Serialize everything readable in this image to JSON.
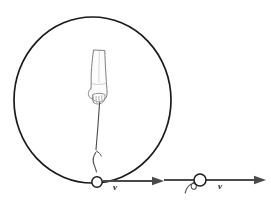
{
  "figure": {
    "background_color": "#ffffff",
    "width": 271,
    "height": 203,
    "stroke_color": "#1a1a1a",
    "arrow_color": "#3a3a3a",
    "hand_fill": "#fbfbfb",
    "hand_outline": "#6a6a6a"
  },
  "circle_path": {
    "name": "circular-path",
    "center_x": 92.5,
    "center_y": 100,
    "radius_x": 78.5,
    "radius_y": 83,
    "stroke_width": 1.6
  },
  "hand": {
    "name": "hand-holding-string",
    "description": "forearm and hand gripping the string at the center of the circle",
    "center_x": 100,
    "top_y": 50,
    "bottom_y": 103
  },
  "string": {
    "name": "string",
    "description": "string from hand down to the ball, with a small curl near the ball indicating release",
    "from_x": 100,
    "from_y": 103,
    "to_x": 95,
    "to_y": 175
  },
  "ball_on_string": {
    "name": "ball-on-circular-path",
    "cx": 97,
    "cy": 182,
    "r": 5.2,
    "stroke_width": 1.4
  },
  "ball_released": {
    "name": "ball-released",
    "cx": 200,
    "cy": 180,
    "r": 6,
    "stroke_width": 1.4,
    "tail_description": "short squiggly loose string trailing to the lower left"
  },
  "vectors": [
    {
      "name": "velocity-vector-on-path",
      "label": "v",
      "label_x": 113,
      "label_y": 183,
      "x1": 103,
      "y1": 181,
      "x2": 163,
      "y2": 181,
      "stroke_width": 2,
      "head_length": 12,
      "head_width": 8
    },
    {
      "name": "velocity-vector-released",
      "label": "v",
      "label_x": 218,
      "label_y": 182,
      "x1": 163,
      "y1": 180,
      "x2": 266,
      "y2": 180,
      "stroke_width": 2,
      "head_length": 12,
      "head_width": 8
    }
  ]
}
